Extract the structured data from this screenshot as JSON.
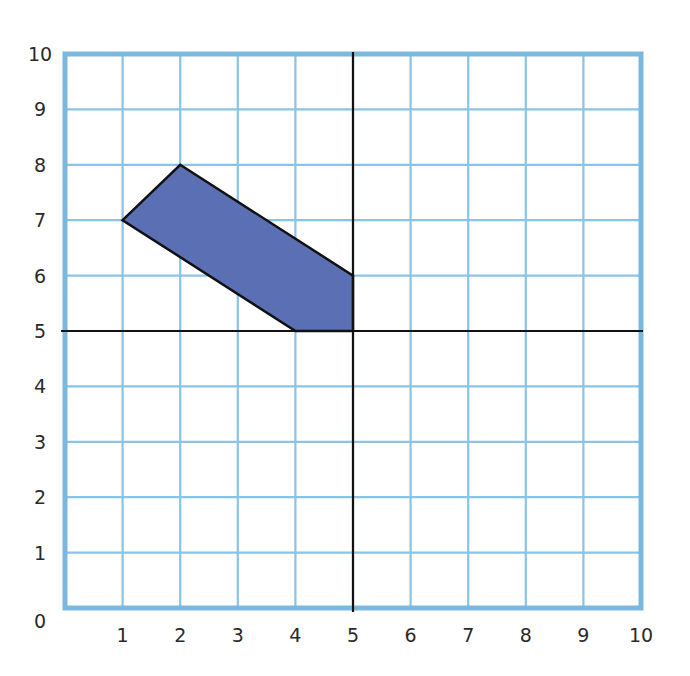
{
  "chart_data": {
    "type": "polygon-on-grid",
    "title": "",
    "xlabel": "",
    "ylabel": "",
    "xlim": [
      0,
      10
    ],
    "ylim": [
      0,
      10
    ],
    "grid": true,
    "x_ticks": [
      "1",
      "2",
      "3",
      "4",
      "5",
      "6",
      "7",
      "8",
      "9",
      "10"
    ],
    "y_ticks": [
      "0",
      "1",
      "2",
      "3",
      "4",
      "5",
      "6",
      "7",
      "8",
      "9",
      "10"
    ],
    "mirror_lines": [
      {
        "orientation": "vertical",
        "x": 5
      },
      {
        "orientation": "horizontal",
        "y": 5
      }
    ],
    "shape": {
      "name": "shaded-pentagon",
      "vertices": [
        [
          1,
          7
        ],
        [
          2,
          8
        ],
        [
          5,
          6
        ],
        [
          5,
          5
        ],
        [
          4,
          5
        ]
      ],
      "fill": "#5b6fb5",
      "stroke": "#111111"
    }
  },
  "colors": {
    "grid": "#89c3e6",
    "border": "#7ab8e0",
    "axis_line": "#111111",
    "shape_fill": "#5b6fb5"
  }
}
